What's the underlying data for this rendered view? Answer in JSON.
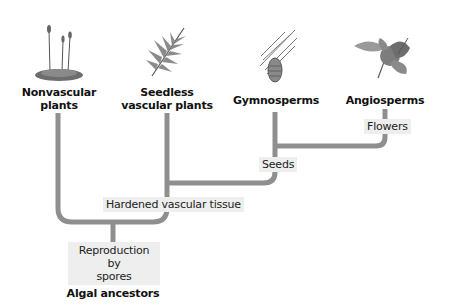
{
  "taxa": {
    "nonvascular": {
      "line1": "Nonvascular",
      "line2": "plants",
      "icon": "moss-icon"
    },
    "seedless": {
      "line1": "Seedless",
      "line2": "vascular plants",
      "icon": "fern-icon"
    },
    "gymnosperms": {
      "label": "Gymnosperms",
      "icon": "pine-cone-icon"
    },
    "angiosperms": {
      "label": "Angiosperms",
      "icon": "flower-icon"
    }
  },
  "traits": {
    "flowers": "Flowers",
    "seeds": "Seeds",
    "hardened": "Hardened vascular tissue",
    "reproduction_line1": "Reproduction by",
    "reproduction_line2": "spores"
  },
  "root": {
    "label": "Algal ancestors"
  },
  "colors": {
    "branch": "#8f8f8f",
    "trait_bg": "#eeeeee",
    "text": "#111111"
  }
}
